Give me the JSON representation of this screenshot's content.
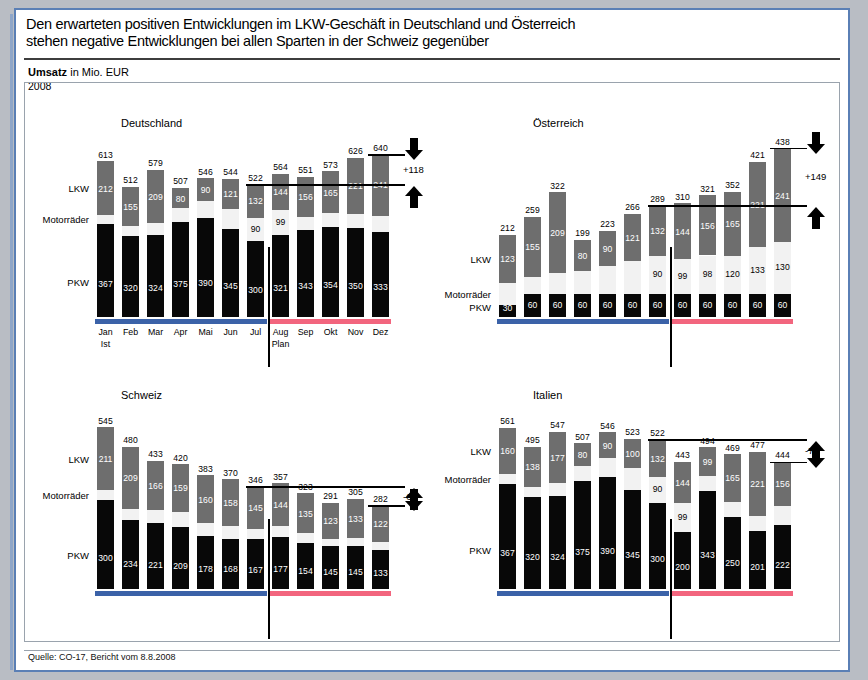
{
  "header": {
    "line1": "Den erwarteten positiven Entwicklungen im LKW-Geschäft in Deutschland und Österreich",
    "line2": "stehen negative Entwicklungen bei allen Sparten in der Schweiz gegenüber"
  },
  "subtitle": {
    "bold": "Umsatz",
    "rest": " in Mio. EUR",
    "year": "2008"
  },
  "source": "Quelle: CO-17, Bericht vom 8.8.2008",
  "series_labels": {
    "lkw": "LKW",
    "motorraeder": "Motorräder",
    "pkw": "PKW"
  },
  "period_notes": {
    "ist": "Ist",
    "plan": "Plan"
  },
  "colors": {
    "pkw": "#080808",
    "motorraeder": "#f2f2f2",
    "lkw": "#6e6e6e",
    "ist_bar": "#3b62a8",
    "plan_bar": "#f2657e",
    "frame": "#5a7fb5"
  },
  "chart_data": [
    {
      "type": "bar",
      "title": "Deutschland",
      "stacked": true,
      "categories": [
        "Jan",
        "Feb",
        "Mar",
        "Apr",
        "Mai",
        "Jun",
        "Jul",
        "Aug",
        "Sep",
        "Okt",
        "Nov",
        "Dez"
      ],
      "series": [
        {
          "name": "PKW",
          "values": [
            367,
            320,
            324,
            375,
            390,
            345,
            300,
            321,
            343,
            354,
            350,
            333
          ]
        },
        {
          "name": "Motorräder",
          "values": [
            34,
            37,
            46,
            52,
            66,
            78,
            90,
            99,
            52,
            54,
            55,
            66
          ]
        },
        {
          "name": "LKW",
          "values": [
            212,
            155,
            209,
            80,
            90,
            121,
            132,
            144,
            156,
            165,
            221,
            241
          ]
        }
      ],
      "totals": [
        613,
        512,
        579,
        507,
        546,
        544,
        522,
        564,
        551,
        573,
        626,
        640
      ],
      "visible_motorraeder_labels": [
        "",
        "",
        "",
        "",
        "",
        "",
        "90",
        "99",
        "",
        "",
        "",
        ""
      ],
      "delta": "+118",
      "ist_months": 7,
      "ylim": [
        0,
        700
      ]
    },
    {
      "type": "bar",
      "title": "Österreich",
      "stacked": true,
      "categories": [
        "Jan",
        "Feb",
        "Mar",
        "Apr",
        "Mai",
        "Jun",
        "Jul",
        "Aug",
        "Sep",
        "Okt",
        "Nov",
        "Dez"
      ],
      "series": [
        {
          "name": "PKW",
          "values": [
            30,
            60,
            60,
            60,
            60,
            60,
            60,
            60,
            60,
            60,
            60,
            60
          ]
        },
        {
          "name": "Motorräder",
          "values": [
            59,
            44,
            53,
            59,
            73,
            85,
            97,
            90,
            99,
            98,
            120,
            133
          ]
        },
        {
          "name": "LKW",
          "values": [
            123,
            155,
            209,
            80,
            90,
            121,
            132,
            144,
            156,
            165,
            221,
            241
          ]
        }
      ],
      "totals": [
        212,
        259,
        322,
        199,
        223,
        266,
        289,
        310,
        321,
        352,
        421,
        438
      ],
      "visible_motorraeder_labels": [
        "",
        "",
        "",
        "",
        "",
        "",
        "90",
        "99",
        "98",
        "120",
        "133",
        "130"
      ],
      "delta": "+149",
      "ist_months": 7,
      "ylim": [
        0,
        460
      ]
    },
    {
      "type": "bar",
      "title": "Schweiz",
      "stacked": true,
      "categories": [
        "Jan",
        "Feb",
        "Mar",
        "Apr",
        "Mai",
        "Jun",
        "Jul",
        "Aug",
        "Sep",
        "Okt",
        "Nov",
        "Dez"
      ],
      "series": [
        {
          "name": "PKW",
          "values": [
            300,
            234,
            221,
            209,
            178,
            168,
            167,
            177,
            154,
            145,
            145,
            133
          ]
        },
        {
          "name": "Motorräder",
          "values": [
            34,
            37,
            46,
            52,
            45,
            44,
            34,
            36,
            34,
            23,
            27,
            27
          ]
        },
        {
          "name": "LKW",
          "values": [
            211,
            209,
            166,
            159,
            160,
            158,
            145,
            144,
            135,
            123,
            133,
            122
          ]
        }
      ],
      "totals": [
        545,
        480,
        433,
        420,
        383,
        370,
        346,
        357,
        323,
        291,
        305,
        282
      ],
      "visible_motorraeder_labels": [
        "",
        "",
        "",
        "",
        "",
        "",
        "",
        "",
        "",
        "",
        "",
        ""
      ],
      "delta": "-64",
      "ist_months": 7,
      "ylim": [
        0,
        600
      ]
    },
    {
      "type": "bar",
      "title": "Italien",
      "stacked": true,
      "categories": [
        "Jan",
        "Feb",
        "Mar",
        "Apr",
        "Mai",
        "Jun",
        "Jul",
        "Aug",
        "Sep",
        "Okt",
        "Nov",
        "Dez"
      ],
      "series": [
        {
          "name": "PKW",
          "values": [
            367,
            320,
            324,
            375,
            390,
            345,
            300,
            200,
            343,
            250,
            201,
            222
          ]
        },
        {
          "name": "Motorräder",
          "values": [
            34,
            37,
            46,
            52,
            66,
            78,
            90,
            99,
            52,
            54,
            55,
            66
          ]
        },
        {
          "name": "LKW",
          "values": [
            160,
            138,
            177,
            80,
            90,
            100,
            132,
            144,
            99,
            165,
            221,
            156
          ]
        }
      ],
      "totals": [
        561,
        495,
        547,
        507,
        546,
        523,
        522,
        443,
        494,
        469,
        477,
        444
      ],
      "visible_motorraeder_labels": [
        "",
        "",
        "",
        "",
        "",
        "",
        "90",
        "99",
        "",
        "",
        "",
        ""
      ],
      "delta": "-78",
      "ist_months": 7,
      "ylim": [
        0,
        620
      ]
    }
  ]
}
